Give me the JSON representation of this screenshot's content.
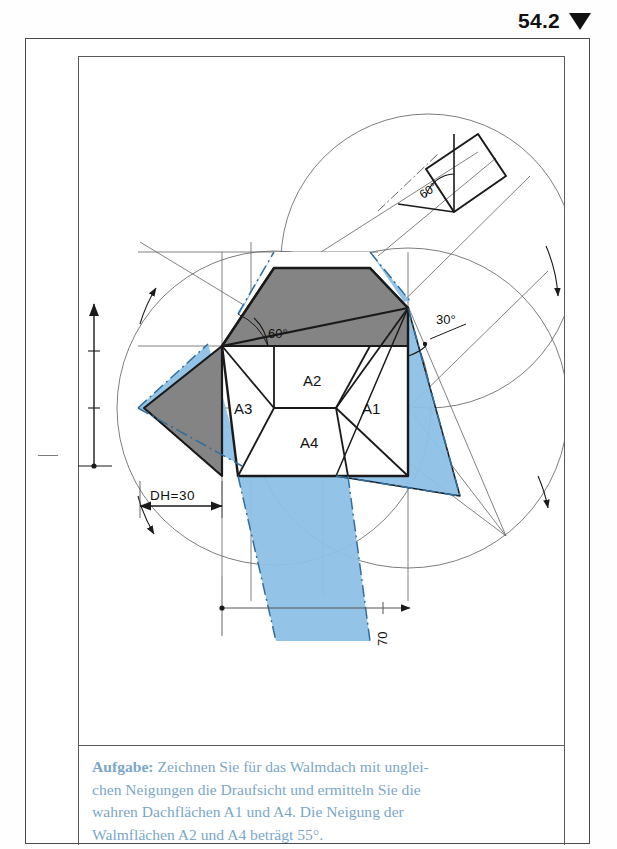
{
  "header": {
    "number": "54.2",
    "marker_icon": "down-triangle-icon"
  },
  "drawing": {
    "title": "Walmdach Draufsicht Konstruktion",
    "area_labels": {
      "a1": "A1",
      "a2": "A2",
      "a3": "A3",
      "a4": "A4"
    },
    "angles": {
      "left_roof": "60°",
      "right_roof": "30°",
      "upper_right_construction": "60°"
    },
    "dimensions": {
      "dh": "DH=30",
      "width": "70",
      "height_upper": "40",
      "height_lower": "20"
    },
    "colors": {
      "blue_fill": "#8dc0e6",
      "gray_fill": "#848484",
      "line": "#1a1a1a",
      "thin_line": "#555555"
    }
  },
  "task": {
    "lead": "Aufgabe:",
    "line1_rest": " Zeichnen Sie für das Walmdach mit unglei-",
    "line2": "chen Neigungen die Draufsicht und ermitteln Sie die",
    "line3": "wahren Dachflächen A1 und A4. Die Neigung der",
    "line4": "Walmflächen A2 und A4 beträgt 55°."
  }
}
